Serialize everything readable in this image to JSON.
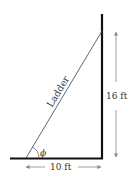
{
  "diagram": {
    "ladder_label": "Ladder",
    "angle_label": "ϕ",
    "height_label": "16 ft",
    "base_label": "10 ft",
    "colors": {
      "wall": "#111111",
      "ground": "#111111",
      "ladder": "#555555",
      "dimension": "#888888",
      "text": "#333333"
    }
  }
}
